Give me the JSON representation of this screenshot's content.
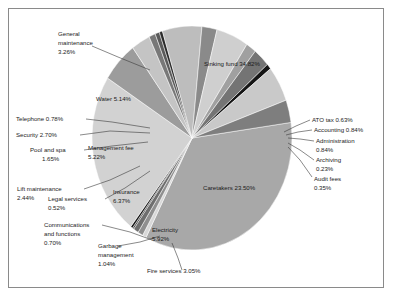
{
  "chart_data": {
    "type": "pie",
    "title": "",
    "subtitle": "",
    "legend_position": "none",
    "grid": false,
    "units": "percent",
    "total": 100.0,
    "start_angle_deg": -8,
    "direction": "clockwise",
    "categories": [
      "Sinking fund",
      "ATO tax",
      "Accounting",
      "Administration",
      "Archiving",
      "Audit fees",
      "Caretakers",
      "Electricity",
      "Fire services",
      "Garbage management",
      "Communications and functions",
      "Legal services",
      "Insurance",
      "Lift maintenance",
      "Management fee",
      "Pool and spa",
      "Security",
      "Telephone",
      "Water",
      "General maintenance"
    ],
    "values": [
      34.82,
      0.63,
      0.84,
      0.84,
      0.23,
      0.35,
      23.5,
      5.92,
      3.05,
      1.04,
      0.7,
      0.52,
      6.37,
      2.44,
      5.22,
      1.65,
      2.7,
      0.78,
      5.14,
      3.26
    ],
    "colors": [
      "#a8a8a8",
      "#d8d8d8",
      "#8f8f8f",
      "#6e6e6e",
      "#3f3f3f",
      "#1a1a1a",
      "#d2d2d2",
      "#9c9c9c",
      "#c4c4c4",
      "#787878",
      "#5a5a5a",
      "#2b2b2b",
      "#bdbdbd",
      "#8a8a8a",
      "#cfcfcf",
      "#a0a0a0",
      "#747474",
      "#151515",
      "#c9c9c9",
      "#7e7e7e"
    ],
    "slices": [
      {
        "label": "Sinking fund",
        "value": 34.82,
        "text": "Sinking fund 34.82%",
        "placement": "inside"
      },
      {
        "label": "ATO tax",
        "value": 0.63,
        "text": "ATO tax 0.63%",
        "placement": "outside"
      },
      {
        "label": "Accounting",
        "value": 0.84,
        "text": "Accounting 0.84%",
        "placement": "outside"
      },
      {
        "label": "Administration",
        "value": 0.84,
        "text": "Administration 0.84%",
        "placement": "outside"
      },
      {
        "label": "Archiving",
        "value": 0.23,
        "text": "Archiving 0.23%",
        "placement": "outside"
      },
      {
        "label": "Audit fees",
        "value": 0.35,
        "text": "Audit fees 0.35%",
        "placement": "outside"
      },
      {
        "label": "Caretakers",
        "value": 23.5,
        "text": "Caretakers 23.50%",
        "placement": "inside"
      },
      {
        "label": "Electricity",
        "value": 5.92,
        "text": "Electricity 5.92%",
        "placement": "inside"
      },
      {
        "label": "Fire services",
        "value": 3.05,
        "text": "Fire services 3.05%",
        "placement": "outside"
      },
      {
        "label": "Garbage management",
        "value": 1.04,
        "text": "Garbage management 1.04%",
        "placement": "outside"
      },
      {
        "label": "Communications and functions",
        "value": 0.7,
        "text": "Communications and functions 0.70%",
        "placement": "outside"
      },
      {
        "label": "Legal services",
        "value": 0.52,
        "text": "Legal services 0.52%",
        "placement": "outside"
      },
      {
        "label": "Insurance",
        "value": 6.37,
        "text": "Insurance 6.37%",
        "placement": "inside"
      },
      {
        "label": "Lift maintenance",
        "value": 2.44,
        "text": "Lift maintenance 2.44%",
        "placement": "outside"
      },
      {
        "label": "Management fee",
        "value": 5.22,
        "text": "Management fee 5.22%",
        "placement": "inside"
      },
      {
        "label": "Pool and spa",
        "value": 1.65,
        "text": "Pool and spa 1.65%",
        "placement": "outside"
      },
      {
        "label": "Security",
        "value": 2.7,
        "text": "Security 2.70%",
        "placement": "outside"
      },
      {
        "label": "Telephone",
        "value": 0.78,
        "text": "Telephone 0.78%",
        "placement": "outside"
      },
      {
        "label": "Water",
        "value": 5.14,
        "text": "Water 5.14%",
        "placement": "inside"
      },
      {
        "label": "General maintenance",
        "value": 3.26,
        "text": "General maintenance 3.26%",
        "placement": "outside"
      }
    ]
  },
  "labels": {
    "general_maintenance_l1": "General",
    "general_maintenance_l2": "maintenance",
    "general_maintenance_l3": "3.26%",
    "telephone": "Telephone 0.78%",
    "security": "Security 2.70%",
    "pool_and_spa_l1": "Pool and spa",
    "pool_and_spa_l2": "1.65%",
    "lift_maintenance_l1": "Lift maintenance",
    "lift_maintenance_l2": "2.44%",
    "legal_services_l1": "Legal services",
    "legal_services_l2": "0.52%",
    "communications_l1": "Communications",
    "communications_l2": "and functions",
    "communications_l3": "0.70%",
    "garbage_l1": "Garbage",
    "garbage_l2": "management",
    "garbage_l3": "1.04%",
    "fire_services": "Fire services 3.05%",
    "ato_tax": "ATO tax 0.63%",
    "accounting": "Accounting 0.84%",
    "administration_l1": "Administration",
    "administration_l2": "0.84%",
    "archiving_l1": "Archiving",
    "archiving_l2": "0.23%",
    "audit_fees_l1": "Audit fees",
    "audit_fees_l2": "0.35%",
    "sinking_fund": "Sinking fund 34.82%",
    "water": "Water 5.14%",
    "management_fee_l1": "Management fee",
    "management_fee_l2": "5.22%",
    "insurance_l1": "Insurance",
    "insurance_l2": "6.37%",
    "caretakers": "Caretakers 23.50%",
    "electricity_l1": "Electricity",
    "electricity_l2": "5.92%"
  },
  "style": {
    "frame_color": "#8a8a8a",
    "background": "#ffffff",
    "text_color": "#1c1c1c"
  }
}
